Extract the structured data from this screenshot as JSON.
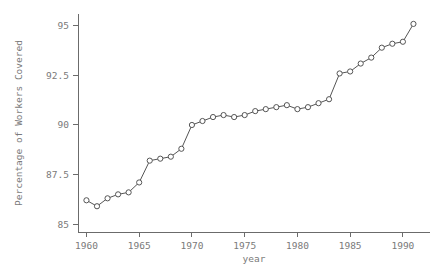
{
  "chart_data": {
    "type": "line",
    "title": "",
    "xlabel": "year",
    "ylabel": "Percentage of Workers Covered",
    "xlim": [
      1959.2,
      1992.0
    ],
    "ylim": [
      84.6,
      95.6
    ],
    "xticks": [
      1960,
      1965,
      1970,
      1975,
      1980,
      1985,
      1990
    ],
    "xtick_labels": [
      "1960",
      "1965",
      "1970",
      "1975",
      "1980",
      "1985",
      "1990"
    ],
    "yticks": [
      85,
      87.5,
      90,
      92.5,
      95
    ],
    "ytick_labels": [
      "85",
      "87.5",
      "90",
      "92.5",
      "95"
    ],
    "grid": false,
    "legend": null,
    "marker": "open-circle",
    "line_color": "#555555",
    "marker_fill": "#ffffff",
    "axis_color": "#6b6b6b",
    "text_color": "#7a7a7a",
    "x": [
      1960,
      1961,
      1962,
      1963,
      1964,
      1965,
      1966,
      1967,
      1968,
      1969,
      1970,
      1971,
      1972,
      1973,
      1974,
      1975,
      1976,
      1977,
      1978,
      1979,
      1980,
      1981,
      1982,
      1983,
      1984,
      1985,
      1986,
      1987,
      1988,
      1989,
      1990,
      1991
    ],
    "values": [
      86.2,
      85.9,
      86.3,
      86.5,
      86.6,
      87.1,
      88.2,
      88.3,
      88.4,
      88.8,
      90.0,
      90.2,
      90.4,
      90.5,
      90.4,
      90.5,
      90.7,
      90.8,
      90.9,
      91.0,
      90.8,
      90.9,
      91.1,
      91.3,
      92.6,
      92.7,
      93.1,
      93.4,
      93.9,
      94.1,
      94.2,
      95.1
    ]
  },
  "plot_geometry": {
    "left": 78,
    "right": 424,
    "top": 14,
    "bottom": 232
  }
}
